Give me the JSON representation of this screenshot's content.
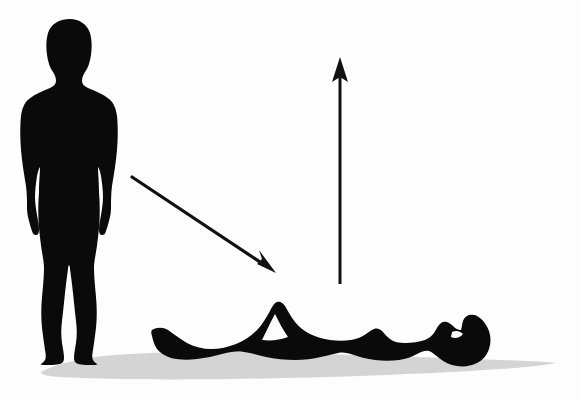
{
  "scene": {
    "title": "Standing to lying down silhouette diagram",
    "width": 578,
    "height": 400,
    "background_color": "#fdfdfd",
    "figure_color": "#0a0a0a",
    "shadow_color": "#d4d4d4",
    "arrow_color": "#111111"
  },
  "elements": {
    "standing_figure": {
      "label": "Standing human silhouette",
      "description": "Front-facing full-body silhouette of a standing person, arms at sides",
      "color": "#0a0a0a",
      "bbox": [
        22,
        19,
        118,
        364
      ]
    },
    "lying_figure": {
      "label": "Lying human silhouette",
      "description": "Side-view silhouette of a person lying supine on the ground with one knee bent, head at the right",
      "color": "#0a0a0a",
      "bbox": [
        150,
        300,
        492,
        368
      ]
    },
    "ground_shadow": {
      "label": "Ground shadow",
      "description": "Light grey cast shadow beneath both figures",
      "color": "#d4d4d4",
      "bbox": [
        40,
        352,
        557,
        381
      ]
    },
    "diagonal_arrow": {
      "label": "Diagonal transition arrow",
      "description": "Arrow pointing down and to the right, from the standing figure toward the lying figure",
      "color": "#111111",
      "from": [
        132,
        177
      ],
      "to": [
        276,
        273
      ],
      "direction": "down-right"
    },
    "vertical_arrow": {
      "label": "Vertical upward arrow",
      "description": "Long straight arrow pointing straight up, positioned above the lying figure's torso",
      "color": "#111111",
      "from": [
        340,
        284
      ],
      "to": [
        340,
        57
      ],
      "direction": "up"
    }
  }
}
